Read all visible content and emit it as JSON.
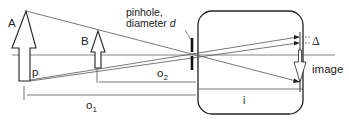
{
  "diagram": {
    "colors": {
      "line": "#555555",
      "dark": "#222222",
      "background": "#ffffff"
    },
    "labels": {
      "object_A": "A",
      "object_B": "B",
      "point_p": "p",
      "pinhole_line1": "pinhole,",
      "pinhole_line2": "diameter ",
      "pinhole_d": "d",
      "delta": "Δ",
      "image": "image",
      "distance_o": "o",
      "o1_sub": "1",
      "o2_sub": "2",
      "distance_i": "i"
    }
  }
}
